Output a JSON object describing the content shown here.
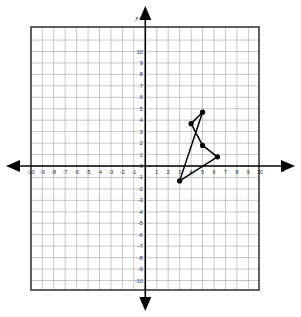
{
  "chart_data": {
    "type": "scatter",
    "title": "",
    "xlabel": "x",
    "ylabel": "y",
    "xlim": [
      -11,
      11
    ],
    "ylim": [
      -11,
      11
    ],
    "grid": true,
    "legend_position": "none",
    "x_ticks": [
      -10,
      -9,
      -8,
      -7,
      -6,
      -5,
      -4,
      -3,
      -2,
      -1,
      1,
      2,
      3,
      4,
      5,
      6,
      7,
      8,
      9,
      10
    ],
    "y_ticks": [
      10,
      9,
      8,
      7,
      6,
      5,
      4,
      3,
      2,
      1,
      0,
      -1,
      -2,
      -3,
      -4,
      -5,
      -6,
      -7,
      -8,
      -9,
      -10
    ],
    "x_tick_labels": [
      "-10",
      "-9",
      "-8",
      "-7",
      "-6",
      "-5",
      "-4",
      "-3",
      "-2",
      "-1",
      "1",
      "2",
      "3",
      "4",
      "5",
      "6",
      "7",
      "8",
      "9",
      "10"
    ],
    "y_tick_labels": [
      "10",
      "9",
      "8",
      "7",
      "6",
      "5",
      "4",
      "3",
      "2",
      "1",
      "0",
      "-1",
      "-2",
      "-3",
      "-4",
      "-5",
      "-6",
      "-7",
      "-8",
      "-9",
      "-10"
    ],
    "series": [
      {
        "name": "polygon",
        "closed": true,
        "points": [
          {
            "x": 5.0,
            "y": 4.7
          },
          {
            "x": 4.0,
            "y": 3.7
          },
          {
            "x": 5.0,
            "y": 1.8
          },
          {
            "x": 6.3,
            "y": 0.8
          },
          {
            "x": 3.0,
            "y": -1.3
          }
        ]
      }
    ],
    "marker_color": "#000000",
    "line_color": "#000000",
    "grid_color": "#b9b9bd",
    "axis_color": "#000000",
    "border_color": "#3a3a3c"
  },
  "axis": {
    "x_name": "x",
    "y_name": "y"
  }
}
